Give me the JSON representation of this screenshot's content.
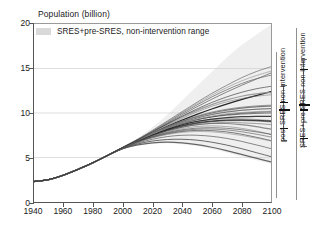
{
  "chart_data": {
    "type": "line",
    "title": "",
    "ylabel": "Population (billion)",
    "xlabel": "",
    "xlim": [
      1940,
      2100
    ],
    "ylim": [
      0,
      20
    ],
    "xticks": [
      1940,
      1960,
      1980,
      2000,
      2020,
      2040,
      2060,
      2080,
      2100
    ],
    "yticks": [
      0,
      5,
      10,
      15,
      20
    ],
    "grid": "horizontal",
    "legend": {
      "position": "top-left-inside",
      "entries": [
        {
          "label": "SRES+pre-SRES, non-intervention range",
          "color": "#d9d9d9",
          "style": "band"
        }
      ]
    },
    "x": [
      1940,
      1950,
      1960,
      1970,
      1980,
      1990,
      2000,
      2010,
      2020,
      2030,
      2040,
      2050,
      2060,
      2070,
      2080,
      2090,
      2100
    ],
    "series": [
      {
        "name": "scenario-01",
        "values": [
          2.3,
          2.52,
          3.02,
          3.69,
          4.43,
          5.26,
          6.12,
          6.95,
          7.75,
          8.5,
          9.2,
          9.85,
          10.45,
          11.0,
          11.5,
          11.95,
          12.4
        ]
      },
      {
        "name": "scenario-02",
        "values": [
          2.3,
          2.52,
          3.02,
          3.69,
          4.43,
          5.26,
          6.12,
          6.98,
          7.9,
          8.85,
          9.8,
          10.7,
          11.55,
          12.35,
          13.1,
          13.8,
          14.5
        ]
      },
      {
        "name": "scenario-03",
        "values": [
          2.3,
          2.52,
          3.02,
          3.69,
          4.43,
          5.26,
          6.15,
          7.05,
          8.05,
          9.1,
          10.15,
          11.2,
          12.2,
          13.1,
          13.95,
          14.65,
          15.2
        ]
      },
      {
        "name": "scenario-04",
        "values": [
          2.3,
          2.52,
          3.02,
          3.69,
          4.43,
          5.26,
          6.1,
          6.9,
          7.65,
          8.3,
          8.85,
          9.25,
          9.55,
          9.75,
          9.88,
          9.95,
          10.0
        ]
      },
      {
        "name": "scenario-05",
        "values": [
          2.3,
          2.52,
          3.02,
          3.69,
          4.43,
          5.26,
          6.1,
          6.88,
          7.6,
          8.2,
          8.7,
          9.05,
          9.25,
          9.35,
          9.35,
          9.28,
          9.15
        ]
      },
      {
        "name": "scenario-06",
        "values": [
          2.3,
          2.52,
          3.02,
          3.69,
          4.43,
          5.26,
          6.08,
          6.82,
          7.45,
          7.98,
          8.4,
          8.68,
          8.82,
          8.82,
          8.7,
          8.48,
          8.18
        ]
      },
      {
        "name": "scenario-07",
        "values": [
          2.3,
          2.52,
          3.02,
          3.69,
          4.43,
          5.26,
          6.08,
          6.8,
          7.4,
          7.88,
          8.25,
          8.48,
          8.55,
          8.48,
          8.28,
          7.98,
          7.6
        ]
      },
      {
        "name": "scenario-08",
        "values": [
          2.3,
          2.52,
          3.02,
          3.69,
          4.43,
          5.26,
          6.05,
          6.72,
          7.25,
          7.65,
          7.92,
          8.05,
          8.02,
          7.88,
          7.62,
          7.28,
          6.9
        ]
      },
      {
        "name": "scenario-09",
        "values": [
          2.3,
          2.52,
          3.02,
          3.69,
          4.43,
          5.26,
          6.02,
          6.62,
          7.05,
          7.35,
          7.5,
          7.5,
          7.38,
          7.15,
          6.82,
          6.42,
          6.0
        ]
      },
      {
        "name": "scenario-10",
        "values": [
          2.3,
          2.52,
          3.02,
          3.69,
          4.43,
          5.26,
          6.0,
          6.52,
          6.85,
          7.02,
          7.05,
          6.95,
          6.72,
          6.4,
          6.0,
          5.55,
          5.1
        ]
      },
      {
        "name": "scenario-11",
        "values": [
          2.3,
          2.52,
          3.02,
          3.69,
          4.43,
          5.26,
          5.98,
          6.42,
          6.65,
          6.72,
          6.65,
          6.45,
          6.15,
          5.78,
          5.35,
          4.92,
          4.5
        ]
      },
      {
        "name": "scenario-12",
        "values": [
          2.3,
          2.52,
          3.02,
          3.69,
          4.43,
          5.26,
          6.12,
          6.96,
          7.8,
          8.62,
          9.4,
          10.12,
          10.75,
          11.25,
          11.62,
          11.88,
          12.05
        ]
      },
      {
        "name": "scenario-13",
        "values": [
          2.3,
          2.52,
          3.02,
          3.69,
          4.43,
          5.26,
          6.12,
          6.94,
          7.72,
          8.45,
          9.1,
          9.65,
          10.1,
          10.42,
          10.65,
          10.8,
          10.88
        ]
      },
      {
        "name": "scenario-14",
        "values": [
          2.3,
          2.52,
          3.02,
          3.69,
          4.43,
          5.26,
          6.11,
          6.92,
          7.68,
          8.38,
          9.0,
          9.5,
          9.88,
          10.15,
          10.32,
          10.42,
          10.48
        ]
      },
      {
        "name": "scenario-15",
        "values": [
          2.3,
          2.52,
          3.02,
          3.69,
          4.43,
          5.26,
          6.11,
          6.9,
          7.62,
          8.25,
          8.8,
          9.25,
          9.58,
          9.82,
          9.98,
          10.08,
          10.15
        ]
      },
      {
        "name": "scenario-16",
        "values": [
          2.3,
          2.52,
          3.02,
          3.69,
          4.43,
          5.26,
          6.1,
          6.88,
          7.58,
          8.18,
          8.68,
          9.05,
          9.3,
          9.48,
          9.58,
          9.62,
          9.62
        ]
      },
      {
        "name": "scenario-17",
        "values": [
          2.3,
          2.52,
          3.02,
          3.69,
          4.43,
          5.26,
          6.09,
          6.85,
          7.5,
          8.05,
          8.5,
          8.82,
          9.02,
          9.12,
          9.15,
          9.1,
          9.0
        ]
      },
      {
        "name": "scenario-18",
        "values": [
          2.3,
          2.52,
          3.02,
          3.69,
          4.43,
          5.26,
          6.09,
          6.84,
          7.48,
          8.0,
          8.4,
          8.68,
          8.85,
          8.92,
          8.9,
          8.82,
          8.7
        ]
      },
      {
        "name": "scenario-19",
        "values": [
          2.3,
          2.52,
          3.02,
          3.69,
          4.43,
          5.26,
          6.13,
          7.0,
          7.95,
          8.95,
          9.95,
          10.9,
          11.8,
          12.6,
          13.3,
          13.85,
          14.25
        ]
      },
      {
        "name": "scenario-20",
        "values": [
          2.3,
          2.52,
          3.02,
          3.69,
          4.43,
          5.26,
          6.13,
          7.02,
          8.0,
          9.02,
          10.05,
          11.05,
          12.0,
          12.85,
          13.6,
          14.2,
          14.7
        ]
      },
      {
        "name": "scenario-21",
        "values": [
          2.3,
          2.52,
          3.02,
          3.69,
          4.43,
          5.26,
          6.12,
          6.97,
          7.85,
          8.72,
          9.55,
          10.3,
          10.95,
          11.48,
          11.88,
          12.15,
          12.3
        ]
      },
      {
        "name": "scenario-22",
        "values": [
          2.3,
          2.52,
          3.02,
          3.69,
          4.43,
          5.26,
          6.1,
          6.87,
          7.55,
          8.12,
          8.58,
          8.9,
          9.1,
          9.2,
          9.22,
          9.18,
          9.1
        ]
      },
      {
        "name": "scenario-23",
        "values": [
          2.3,
          2.52,
          3.02,
          3.69,
          4.43,
          5.26,
          6.07,
          6.78,
          7.35,
          7.8,
          8.12,
          8.3,
          8.35,
          8.28,
          8.12,
          7.88,
          7.6
        ]
      },
      {
        "name": "scenario-24",
        "values": [
          2.3,
          2.52,
          3.02,
          3.69,
          4.43,
          5.26,
          6.06,
          6.75,
          7.3,
          7.72,
          8.02,
          8.18,
          8.2,
          8.1,
          7.9,
          7.62,
          7.3
        ]
      },
      {
        "name": "scenario-25",
        "values": [
          2.3,
          2.52,
          3.02,
          3.69,
          4.43,
          5.26,
          6.11,
          6.91,
          7.65,
          8.32,
          8.92,
          9.42,
          9.82,
          10.1,
          10.3,
          10.42,
          10.5
        ]
      },
      {
        "name": "scenario-26",
        "values": [
          2.3,
          2.52,
          3.02,
          3.69,
          4.43,
          5.26,
          6.12,
          6.93,
          7.7,
          8.42,
          9.05,
          9.58,
          10.0,
          10.32,
          10.55,
          10.7,
          10.78
        ]
      },
      {
        "name": "scenario-27",
        "values": [
          2.3,
          2.52,
          3.02,
          3.69,
          4.43,
          5.26,
          6.05,
          6.7,
          7.2,
          7.58,
          7.82,
          7.92,
          7.88,
          7.72,
          7.48,
          7.18,
          6.85
        ]
      },
      {
        "name": "scenario-28",
        "values": [
          2.3,
          2.52,
          3.02,
          3.69,
          4.43,
          5.26,
          6.1,
          6.89,
          7.62,
          8.28,
          8.85,
          9.3,
          9.65,
          9.9,
          10.05,
          10.15,
          10.2
        ]
      },
      {
        "name": "scenario-29",
        "values": [
          2.3,
          2.52,
          3.02,
          3.69,
          4.43,
          5.26,
          6.13,
          6.99,
          7.88,
          8.78,
          9.65,
          10.45,
          11.18,
          11.8,
          12.32,
          12.72,
          13.0
        ]
      },
      {
        "name": "scenario-30",
        "values": [
          2.3,
          2.52,
          3.02,
          3.69,
          4.43,
          5.26,
          6.09,
          6.86,
          7.52,
          8.08,
          8.52,
          8.85,
          9.05,
          9.18,
          9.2,
          9.15,
          9.05
        ]
      }
    ],
    "band": {
      "label": "SRES+pre-SRES, non-intervention range",
      "color": "#ececec",
      "x": [
        1990,
        2000,
        2010,
        2020,
        2030,
        2040,
        2050,
        2060,
        2070,
        2080,
        2090,
        2100
      ],
      "upper": [
        5.26,
        6.2,
        7.2,
        8.4,
        9.8,
        11.4,
        13.0,
        14.6,
        16.2,
        17.6,
        18.8,
        19.9
      ],
      "lower": [
        5.26,
        5.95,
        6.35,
        6.55,
        6.6,
        6.5,
        6.28,
        5.95,
        5.55,
        5.12,
        4.7,
        4.3
      ]
    }
  },
  "annotations": {
    "ranges": [
      {
        "id": "post-sres",
        "label": "post-SRES non-intervention",
        "low": 7.0,
        "high": 13.1,
        "marks": [
          8.3,
          10.5,
          11.2
        ]
      },
      {
        "id": "sres-pre-sres",
        "label": "SRES+pre-SRES non-intervention",
        "low": 6.3,
        "high": 16.0,
        "marks": [
          7.2,
          10.4,
          11.0,
          14.9
        ]
      }
    ]
  }
}
